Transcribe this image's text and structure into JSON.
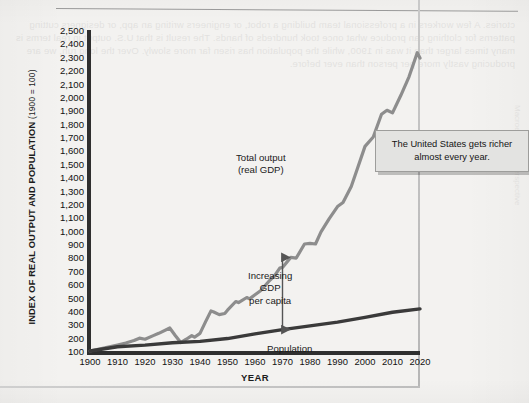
{
  "figure": {
    "ylabel_main": "INDEX OF REAL OUTPUT AND POPULATION",
    "ylabel_paren": "(1900 = 100)",
    "xlabel": "YEAR",
    "callout": "The United States gets richer almost every year.",
    "annotations": {
      "gdp_line1": "Total output",
      "gdp_line2": "(real GDP)",
      "gap_line1": "Increasing",
      "gap_line2": "GDP",
      "gap_line3": "per capita",
      "population": "Population"
    },
    "colors": {
      "gdp_line": "#8d8d8d",
      "population_line": "#3a3a3a",
      "axis": "#2f2f2f",
      "plot_background": "#f4f3f1",
      "callout_background": "#e3e3e1",
      "callout_border": "#9d9d9b"
    },
    "ghost_text": "ctories. A few workers in a professional team building a robot, or engineers writing an app, or designers cutting patterns for clothing can produce what once took hundreds of hands. The result is that U.S. output in real terms is many times larger than it was in 1900, while the population has risen far more slowly. Over the long run, we are producing vastly more per person than ever before.",
    "ghost_text_margin": "Macroeconomic Perspective"
  },
  "chart_data": {
    "type": "line",
    "title": "",
    "xlabel": "YEAR",
    "ylabel": "INDEX OF REAL OUTPUT AND POPULATION (1900 = 100)",
    "xlim": [
      1900,
      2020
    ],
    "ylim": [
      100,
      2500
    ],
    "xticks": [
      1900,
      1910,
      1920,
      1930,
      1940,
      1950,
      1960,
      1970,
      1980,
      1990,
      2000,
      2010,
      2020
    ],
    "yticks": [
      100,
      200,
      300,
      400,
      500,
      600,
      700,
      800,
      900,
      1000,
      1100,
      1200,
      1300,
      1400,
      1500,
      1600,
      1700,
      1800,
      1900,
      2000,
      2100,
      2200,
      2300,
      2400,
      2500
    ],
    "ytick_labels": [
      "100",
      "200",
      "300",
      "400",
      "500",
      "600",
      "700",
      "800",
      "900",
      "1,000",
      "1,100",
      "1,200",
      "1,300",
      "1,400",
      "1,500",
      "1,600",
      "1,700",
      "1,800",
      "1,900",
      "2,000",
      "2,100",
      "2,200",
      "2,300",
      "2,400",
      "2,500"
    ],
    "grid": false,
    "legend": "inline-annotations",
    "series": [
      {
        "name": "Total output (real GDP)",
        "color": "#8d8d8d",
        "x": [
          1900,
          1905,
          1910,
          1913,
          1916,
          1918,
          1920,
          1923,
          1925,
          1929,
          1931,
          1933,
          1935,
          1937,
          1938,
          1940,
          1942,
          1944,
          1945,
          1947,
          1949,
          1950,
          1953,
          1954,
          1957,
          1958,
          1960,
          1962,
          1965,
          1967,
          1969,
          1970,
          1973,
          1975,
          1978,
          1980,
          1982,
          1984,
          1987,
          1990,
          1992,
          1995,
          1997,
          2000,
          2003,
          2006,
          2008,
          2010,
          2013,
          2016,
          2019,
          2020
        ],
        "values": [
          100,
          122,
          145,
          160,
          178,
          196,
          188,
          215,
          232,
          272,
          216,
          163,
          188,
          215,
          203,
          232,
          318,
          400,
          392,
          372,
          380,
          405,
          470,
          462,
          500,
          490,
          520,
          550,
          620,
          660,
          720,
          725,
          800,
          795,
          900,
          905,
          900,
          990,
          1090,
          1180,
          1210,
          1330,
          1450,
          1630,
          1700,
          1870,
          1900,
          1880,
          2010,
          2150,
          2330,
          2290
        ]
      },
      {
        "name": "Population",
        "color": "#3a3a3a",
        "x": [
          1900,
          1910,
          1920,
          1930,
          1940,
          1950,
          1960,
          1970,
          1980,
          1990,
          2000,
          2010,
          2020
        ],
        "values": [
          100,
          132,
          144,
          162,
          172,
          193,
          228,
          260,
          288,
          316,
          352,
          390,
          415
        ]
      }
    ],
    "annotations": [
      {
        "text": "Total output (real GDP)",
        "x": 1968,
        "y": 1480,
        "type": "series-label"
      },
      {
        "text": "Increasing GDP per capita",
        "x": 1972,
        "y": 640,
        "type": "gap-label"
      },
      {
        "text": "Population",
        "x": 1975,
        "y": 180,
        "type": "series-label"
      },
      {
        "text": "The United States gets richer almost every year.",
        "x": 2010,
        "y": 1700,
        "type": "callout"
      }
    ],
    "gap_arrow": {
      "x": 1970,
      "y_top": 800,
      "y_bottom": 260,
      "double_headed": true
    }
  }
}
